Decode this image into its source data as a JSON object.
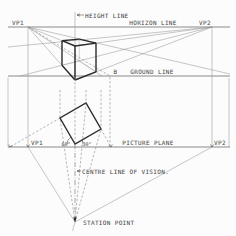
{
  "diagram": {
    "labels": {
      "height_line": "HEIGHT LINE",
      "horizon_line": "HORIZON LINE",
      "vp1_top": "VP1",
      "vp2_top": "VP2",
      "point_b": "B",
      "ground_line": "GROUND LINE",
      "vp1_bottom": "VP1",
      "vp2_bottom": "VP2",
      "picture_plane": "PICTURE PLANE",
      "angle_left": "60°",
      "angle_right": "30°",
      "centre_line_of_vision": "CENTRE LINE OF VISION.",
      "station_point": "STATION POINT"
    },
    "colors": {
      "background": "#fcfcfc",
      "heavy_line": "#2b2b2b",
      "main_line": "#5a5a5a",
      "construction_line": "#8f8f8f",
      "dashed_line": "#7a7a7a",
      "text": "#3f3f3f"
    }
  }
}
